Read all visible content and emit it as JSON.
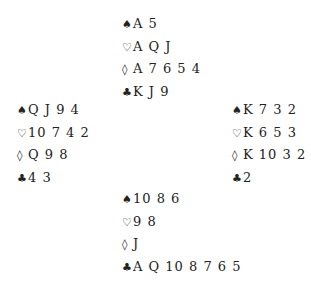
{
  "hands": {
    "north": {
      "spades": {
        "symbol": "♠",
        "cards": "A 5"
      },
      "hearts": {
        "symbol": "♡",
        "cards": "A Q J"
      },
      "diamonds": {
        "symbol": "◊",
        "cards": "A 7 6 5 4"
      },
      "clubs": {
        "symbol": "♣",
        "cards": "K J 9"
      }
    },
    "west": {
      "spades": {
        "symbol": "♠",
        "cards": "Q J 9 4"
      },
      "hearts": {
        "symbol": "♡",
        "cards": "10 7 4 2"
      },
      "diamonds": {
        "symbol": "◊",
        "cards": "Q 9 8"
      },
      "clubs": {
        "symbol": "♣",
        "cards": "4 3"
      }
    },
    "east": {
      "spades": {
        "symbol": "♠",
        "cards": "K 7 3 2"
      },
      "hearts": {
        "symbol": "♡",
        "cards": "K 6 5 3"
      },
      "diamonds": {
        "symbol": "◊",
        "cards": "K 10 3 2"
      },
      "clubs": {
        "symbol": "♣",
        "cards": "2"
      }
    },
    "south": {
      "spades": {
        "symbol": "♠",
        "cards": "10 8 6"
      },
      "hearts": {
        "symbol": "♡",
        "cards": "9 8"
      },
      "diamonds": {
        "symbol": "◊",
        "cards": "J"
      },
      "clubs": {
        "symbol": "♣",
        "cards": "A Q 10 8 7 6 5"
      }
    }
  }
}
